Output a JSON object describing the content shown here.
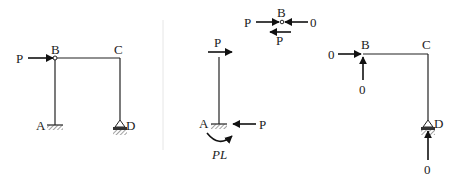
{
  "figure": {
    "panels": [
      {
        "id": "frame",
        "description": "Portal frame ABCD with horizontal load P at hinge B; A fixed, D roller support",
        "nodes": {
          "A": "A",
          "B": "B",
          "C": "C",
          "D": "D"
        },
        "load_label": "P"
      },
      {
        "id": "column-ab-fbd",
        "description": "Free body of column AB with load P at top, fixed base reactions",
        "top_load_label": "P",
        "node_label": "A",
        "base_reaction_label": "P",
        "moment_label": "PL"
      },
      {
        "id": "hinge-b-fbd",
        "description": "Free body of hinge B",
        "node_label": "B",
        "left_load_label": "P",
        "right_force_label": "0",
        "bottom_force_label": "P"
      },
      {
        "id": "bcd-fbd",
        "description": "Free body of member BCD with zero forces",
        "nodes": {
          "B": "B",
          "C": "C",
          "D": "D"
        },
        "b_horizontal_label": "0",
        "b_vertical_label": "0",
        "d_vertical_label": "0"
      }
    ]
  }
}
